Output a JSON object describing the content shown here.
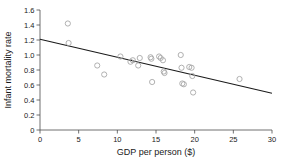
{
  "chart_data": {
    "type": "scatter",
    "title": "",
    "xlabel": "GDP per person ($)",
    "ylabel": "Infant mortality rate",
    "xlim": [
      0,
      30
    ],
    "ylim": [
      0,
      1.6
    ],
    "xticks": [
      "0",
      "5",
      "10",
      "15",
      "20",
      "25",
      "30"
    ],
    "xtick_values": [
      0,
      5,
      10,
      15,
      20,
      25,
      30
    ],
    "yticks": [
      "0",
      "0.2",
      "0.4",
      "0.6",
      "0.8",
      "1.0",
      "1.2",
      "1.4",
      "1.6"
    ],
    "ytick_values": [
      0,
      0.2,
      0.4,
      0.6,
      0.8,
      1.0,
      1.2,
      1.4,
      1.6
    ],
    "grid": false,
    "legend": false,
    "marker_style": "open-circle",
    "marker_color": "#a8a8a8",
    "line_color": "#1a1a1a",
    "series": [
      {
        "name": "countries",
        "x": [
          3.6,
          3.7,
          7.4,
          8.3,
          10.4,
          11.7,
          12.0,
          12.7,
          12.9,
          14.3,
          14.4,
          14.5,
          15.4,
          15.6,
          15.9,
          16.0,
          16.1,
          18.2,
          18.3,
          18.4,
          18.6,
          19.3,
          19.6,
          19.7,
          19.8,
          25.8
        ],
        "y": [
          1.42,
          1.16,
          0.86,
          0.74,
          0.98,
          0.91,
          0.93,
          0.86,
          0.96,
          0.97,
          0.95,
          0.64,
          0.98,
          0.96,
          0.93,
          0.78,
          0.76,
          1.0,
          0.83,
          0.62,
          0.61,
          0.84,
          0.83,
          0.72,
          0.5,
          0.68
        ]
      }
    ],
    "trendline": {
      "name": "least-squares fit",
      "x_start": 0,
      "y_start": 1.21,
      "x_end": 30,
      "y_end": 0.49
    }
  }
}
